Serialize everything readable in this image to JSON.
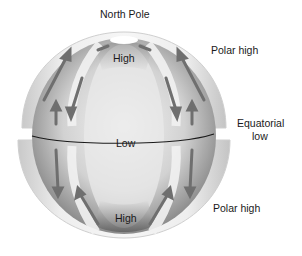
{
  "diagram": {
    "labels": {
      "north_pole": "North Pole",
      "polar_high_top": "Polar high",
      "equatorial_low_line1": "Equatorial",
      "equatorial_low_line2": "low",
      "polar_high_bottom": "Polar high",
      "high_top": "High",
      "low_center": "Low",
      "high_bottom": "High"
    }
  }
}
